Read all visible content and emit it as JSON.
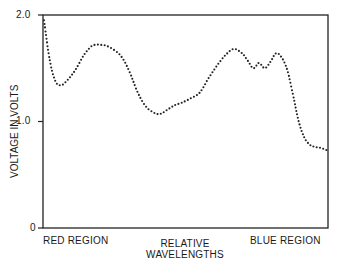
{
  "chart_data": {
    "type": "line",
    "style": "dotted",
    "title": "",
    "xlabel": "RELATIVE WAVELENGTHS",
    "ylabel": "VOLTAGE IN VOLTS",
    "x_tick_labels": {
      "left": "RED REGION",
      "right": "BLUE REGION"
    },
    "y_ticks": [
      "0",
      "1.0",
      "2.0"
    ],
    "ylim": [
      0,
      2.0
    ],
    "xlim": [
      0,
      1
    ],
    "grid": false,
    "x": [
      0.0,
      0.02,
      0.04,
      0.06,
      0.08,
      0.11,
      0.14,
      0.17,
      0.2,
      0.23,
      0.27,
      0.3,
      0.33,
      0.36,
      0.39,
      0.41,
      0.43,
      0.46,
      0.49,
      0.52,
      0.55,
      0.58,
      0.61,
      0.64,
      0.67,
      0.7,
      0.72,
      0.74,
      0.76,
      0.78,
      0.8,
      0.82,
      0.84,
      0.86,
      0.88,
      0.9,
      0.92,
      0.94,
      0.96,
      0.98,
      1.0
    ],
    "values": [
      1.95,
      1.58,
      1.38,
      1.34,
      1.38,
      1.48,
      1.62,
      1.71,
      1.72,
      1.7,
      1.62,
      1.48,
      1.28,
      1.14,
      1.08,
      1.07,
      1.1,
      1.15,
      1.18,
      1.22,
      1.27,
      1.4,
      1.52,
      1.62,
      1.68,
      1.64,
      1.57,
      1.5,
      1.55,
      1.5,
      1.56,
      1.64,
      1.6,
      1.48,
      1.25,
      1.0,
      0.85,
      0.78,
      0.76,
      0.75,
      0.73
    ]
  },
  "labels": {
    "ytick_2": "2.0",
    "ytick_1": "1.0",
    "ytick_0": "0",
    "ylabel": "VOLTAGE IN VOLTS",
    "x_left": "RED REGION",
    "x_right": "BLUE REGION",
    "xlabel_line1": "RELATIVE",
    "xlabel_line2": "WAVELENGTHS"
  }
}
